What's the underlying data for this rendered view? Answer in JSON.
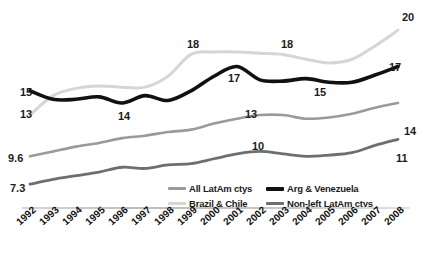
{
  "chart_data": {
    "type": "line",
    "title": "",
    "subtitle": "",
    "xlabel": "",
    "ylabel": "",
    "grid": false,
    "legend_position": "bottom",
    "x": [
      1992,
      1993,
      1994,
      1995,
      1996,
      1997,
      1998,
      1999,
      2000,
      2001,
      2002,
      2003,
      2004,
      2005,
      2006,
      2007,
      2008
    ],
    "xtick_labels": [
      "1992",
      "1993",
      "1994",
      "1995",
      "1996",
      "1997",
      "1998",
      "1999",
      "2000",
      "2001",
      "2002",
      "2003",
      "2004",
      "2005",
      "2006",
      "2007",
      "2008"
    ],
    "ylim": [
      6,
      21
    ],
    "series": [
      {
        "name": "Brazil & Chile",
        "color": "#d6d6d6",
        "width": 3.0,
        "values": [
          13.0,
          14.6,
          15.2,
          15.4,
          15.3,
          15.3,
          16.2,
          18.0,
          18.2,
          18.2,
          18.1,
          18.0,
          17.6,
          17.3,
          17.6,
          18.7,
          20.0
        ],
        "point_labels": [
          {
            "x": 1992,
            "value": "13",
            "side": "left"
          },
          {
            "x": 1999,
            "value": "18",
            "side": "above"
          },
          {
            "x": 2003,
            "value": "18",
            "side": "above"
          },
          {
            "x": 2008,
            "value": "20",
            "side": "right"
          }
        ]
      },
      {
        "name": "Arg & Venezuela",
        "color": "#111111",
        "width": 3.6,
        "values": [
          15.0,
          14.3,
          14.3,
          14.5,
          14.0,
          14.6,
          14.2,
          15.0,
          16.2,
          17.0,
          15.9,
          15.8,
          16.0,
          15.7,
          15.7,
          16.3,
          17.0
        ],
        "point_labels": [
          {
            "x": 1992,
            "value": "15",
            "side": "left"
          },
          {
            "x": 1996,
            "value": "14",
            "side": "below"
          },
          {
            "x": 2001,
            "value": "17",
            "side": "below"
          },
          {
            "x": 2005,
            "value": "15",
            "side": "below"
          },
          {
            "x": 2008,
            "value": "17",
            "side": "right"
          }
        ]
      },
      {
        "name": "All LatAm ctys",
        "color": "#9a9a9a",
        "width": 2.6,
        "values": [
          9.6,
          10.0,
          10.4,
          10.7,
          11.1,
          11.3,
          11.6,
          11.8,
          12.3,
          12.7,
          13.0,
          13.0,
          12.7,
          12.8,
          13.1,
          13.6,
          14.0
        ],
        "point_labels": [
          {
            "x": 1992,
            "value": "9.6",
            "side": "left"
          },
          {
            "x": 2002,
            "value": "13",
            "side": "above"
          },
          {
            "x": 2008,
            "value": "14",
            "side": "right"
          }
        ]
      },
      {
        "name": "Non-left LatAm ctys",
        "color": "#6e6e6e",
        "width": 2.8,
        "values": [
          7.3,
          7.7,
          8.0,
          8.3,
          8.7,
          8.6,
          8.9,
          9.0,
          9.4,
          9.8,
          10.0,
          9.8,
          9.6,
          9.7,
          9.9,
          10.5,
          11.0
        ],
        "point_labels": [
          {
            "x": 1992,
            "value": "7.3",
            "side": "left"
          },
          {
            "x": 2002,
            "value": "10",
            "side": "above"
          },
          {
            "x": 2008,
            "value": "11",
            "side": "right"
          }
        ]
      }
    ]
  },
  "legend": {
    "items": [
      {
        "label": "All LatAm ctys",
        "color": "#9a9a9a",
        "thick": false
      },
      {
        "label": "Arg & Venezuela",
        "color": "#111111",
        "thick": true
      },
      {
        "label": "Brazil & Chile",
        "color": "#d6d6d6",
        "thick": false
      },
      {
        "label": "Non-left LatAm ctys",
        "color": "#6e6e6e",
        "thick": false
      }
    ]
  },
  "annotations": {
    "bc_start": "13",
    "bc_1999": "18",
    "bc_2003": "18",
    "bc_end": "20",
    "av_start": "15",
    "av_1996": "14",
    "av_2001": "17",
    "av_2005": "15",
    "av_end": "17",
    "all_start": "9.6",
    "all_2002": "13",
    "all_end": "14",
    "nl_start": "7.3",
    "nl_2002": "10",
    "nl_end": "11"
  }
}
